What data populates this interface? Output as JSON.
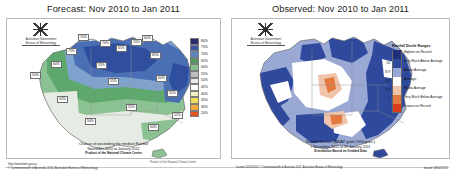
{
  "left": {
    "title": "Forecast: Nov 2010 to Jan 2011",
    "crest": {
      "line1": "Australian Government",
      "line2": "Bureau of Meteorology",
      "icon": "commonwealth-coat-of-arms-icon"
    },
    "caption": {
      "line1": "Chance of exceeding the median Rainfall",
      "line2": "November 2010 to January 2011",
      "line3": "Product of the National Climate Centre"
    },
    "legend": {
      "items": [
        {
          "label": "80%",
          "color": "#2c2b6e"
        },
        {
          "label": "75%",
          "color": "#3a55a4"
        },
        {
          "label": "70%",
          "color": "#5d85c0"
        },
        {
          "label": "65%",
          "color": "#4e9a5c"
        },
        {
          "label": "60%",
          "color": "#84c08a"
        },
        {
          "label": "55%",
          "color": "#bdbdbd"
        },
        {
          "label": "50%",
          "color": "#e9e9e9"
        },
        {
          "label": "45%",
          "color": "#ffffff"
        },
        {
          "label": "40%",
          "color": "#f5f0c4"
        },
        {
          "label": "35%",
          "color": "#efe05a"
        },
        {
          "label": "30%",
          "color": "#f3a93c"
        },
        {
          "label": "20%",
          "color": "#e2561f"
        }
      ]
    },
    "contour_labels": [
      {
        "value": "70%",
        "x": 78,
        "y": 34
      },
      {
        "value": "75%",
        "x": 66,
        "y": 48
      },
      {
        "value": "70%",
        "x": 100,
        "y": 40
      },
      {
        "value": "65%",
        "x": 116,
        "y": 45
      },
      {
        "value": "70%",
        "x": 131,
        "y": 39
      },
      {
        "value": "60%",
        "x": 142,
        "y": 35
      },
      {
        "value": "65%",
        "x": 150,
        "y": 52
      },
      {
        "value": "60%",
        "x": 51,
        "y": 61
      },
      {
        "value": "55%",
        "x": 96,
        "y": 62
      },
      {
        "value": "50%",
        "x": 30,
        "y": 72
      },
      {
        "value": "55%",
        "x": 108,
        "y": 78
      },
      {
        "value": "60%",
        "x": 156,
        "y": 75
      },
      {
        "value": "55%",
        "x": 167,
        "y": 90
      },
      {
        "value": "50%",
        "x": 57,
        "y": 96
      },
      {
        "value": "55%",
        "x": 126,
        "y": 104
      },
      {
        "value": "50%",
        "x": 85,
        "y": 118
      },
      {
        "value": "60%",
        "x": 148,
        "y": 124
      },
      {
        "value": "55%",
        "x": 172,
        "y": 112
      }
    ]
  },
  "right": {
    "title": "Observed: Nov 2010 to Jan 2011",
    "crest": {
      "line1": "Australian Government",
      "line2": "Bureau of Meteorology",
      "icon": "commonwealth-coat-of-arms-icon"
    },
    "caption": {
      "line1": "Rainfall Deciles (AWAP grids 1900-pres.)",
      "line2": "1 November 2010 to 31 January 2011",
      "line3": "Distribution Based on Gridded Data"
    },
    "legend": {
      "title": "Rainfall Decile Ranges",
      "items": [
        {
          "decile": "",
          "label": "Highest on Record",
          "color": "#1f2f78"
        },
        {
          "decile": "10",
          "label": "Very Much Above Average",
          "color": "#2f4a9c"
        },
        {
          "decile": "8-9",
          "label": "Above Average",
          "color": "#9aa8d4"
        },
        {
          "decile": "4-7",
          "label": "Average",
          "color": "#ffffff"
        },
        {
          "decile": "2-3",
          "label": "Below Average",
          "color": "#f0c3ab"
        },
        {
          "decile": "1",
          "label": "Very Much Below Average",
          "color": "#e3793f"
        },
        {
          "decile": "",
          "label": "Lowest on Record",
          "color": "#d93b18"
        }
      ]
    }
  },
  "footer": {
    "note": "Issued: 19/10/2010",
    "copyright_line1": "http://www.bom.gov.au",
    "copyright_line2": "© Commonwealth of Australia 2010, Australian Bureau of Meteorology",
    "right_label": "Issued: 08/02/2011",
    "middle": "Product of the National Climate Centre",
    "right_source": "Issued: 02/02/2011  © Commonwealth of Australia 2011, Australian Bureau of Meteorology"
  }
}
